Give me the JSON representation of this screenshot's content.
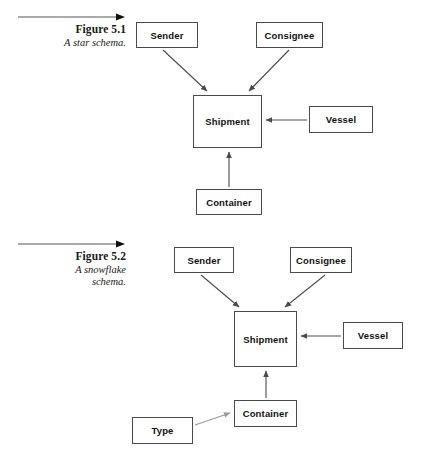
{
  "document": {
    "title": "Star and snowflake schema figures",
    "background_color": "#ffffff",
    "box_border_color": "#4a4a4a",
    "arrow_color": "#4a4a4a",
    "light_arrow_color": "#9a9a9a"
  },
  "figures": [
    {
      "id": "figure-5-1",
      "number": "Figure 5.1",
      "description": "A star schema.",
      "rule_icon": "right-arrow-rule-icon",
      "nodes": [
        {
          "id": "f1-sender",
          "label": "Sender"
        },
        {
          "id": "f1-consignee",
          "label": "Consignee"
        },
        {
          "id": "f1-shipment",
          "label": "Shipment"
        },
        {
          "id": "f1-vessel",
          "label": "Vessel"
        },
        {
          "id": "f1-container",
          "label": "Container"
        }
      ],
      "edges": [
        {
          "from": "Sender",
          "to": "Shipment",
          "style": "solid-dark"
        },
        {
          "from": "Consignee",
          "to": "Shipment",
          "style": "solid-dark"
        },
        {
          "from": "Vessel",
          "to": "Shipment",
          "style": "solid-dark"
        },
        {
          "from": "Container",
          "to": "Shipment",
          "style": "solid-dark"
        }
      ]
    },
    {
      "id": "figure-5-2",
      "number": "Figure 5.2",
      "description": "A snowflake\nschema.",
      "rule_icon": "right-arrow-rule-icon",
      "nodes": [
        {
          "id": "f2-sender",
          "label": "Sender"
        },
        {
          "id": "f2-consignee",
          "label": "Consignee"
        },
        {
          "id": "f2-shipment",
          "label": "Shipment"
        },
        {
          "id": "f2-vessel",
          "label": "Vessel"
        },
        {
          "id": "f2-container",
          "label": "Container"
        },
        {
          "id": "f2-type",
          "label": "Type"
        }
      ],
      "edges": [
        {
          "from": "Sender",
          "to": "Shipment",
          "style": "solid-dark"
        },
        {
          "from": "Consignee",
          "to": "Shipment",
          "style": "solid-dark"
        },
        {
          "from": "Vessel",
          "to": "Shipment",
          "style": "solid-dark"
        },
        {
          "from": "Container",
          "to": "Shipment",
          "style": "solid-dark"
        },
        {
          "from": "Type",
          "to": "Container",
          "style": "solid-light"
        }
      ]
    }
  ]
}
